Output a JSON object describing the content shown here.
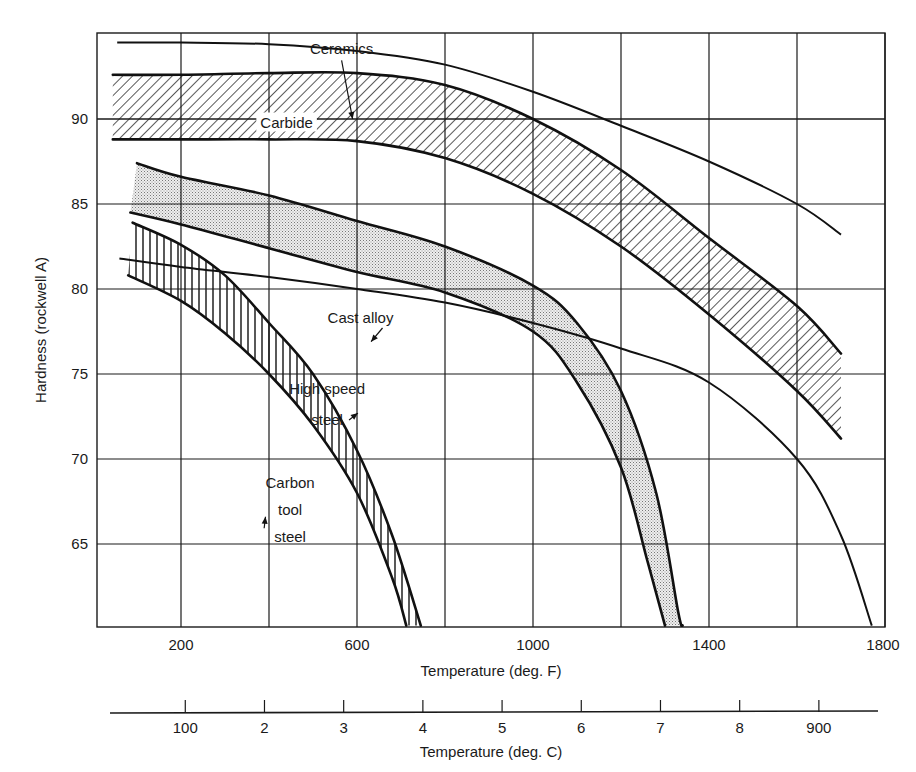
{
  "chart_data": {
    "type": "line",
    "title": "",
    "xlabel": "Temperature (deg. F)",
    "ylabel": "Hardness (rockwell A)",
    "secondary_xlabel": "Temperature (deg. C)",
    "xlim": [
      10,
      1800
    ],
    "ylim": [
      60.2,
      95
    ],
    "grid": true,
    "x_ticks": [
      200,
      600,
      1000,
      1400,
      1800
    ],
    "x_gridlines": [
      200,
      400,
      600,
      800,
      1000,
      1200,
      1400,
      1600,
      1800
    ],
    "y_ticks": [
      65,
      70,
      75,
      80,
      85,
      90
    ],
    "secondary_x_ticks": [
      {
        "label": "100",
        "F": 212
      },
      {
        "label": "2",
        "F": 392
      },
      {
        "label": "3",
        "F": 572
      },
      {
        "label": "4",
        "F": 752
      },
      {
        "label": "5",
        "F": 932
      },
      {
        "label": "6",
        "F": 1112
      },
      {
        "label": "7",
        "F": 1292
      },
      {
        "label": "8",
        "F": 1472
      },
      {
        "label": "900",
        "F": 1652
      }
    ],
    "series": [
      {
        "name": "Ceramics",
        "kind": "line",
        "points": [
          [
            55,
            94.5
          ],
          [
            200,
            94.5
          ],
          [
            400,
            94.4
          ],
          [
            600,
            94.0
          ],
          [
            800,
            93.2
          ],
          [
            1000,
            91.6
          ],
          [
            1200,
            89.6
          ],
          [
            1400,
            87.5
          ],
          [
            1600,
            85.0
          ],
          [
            1700,
            83.2
          ]
        ]
      },
      {
        "name": "Carbide",
        "kind": "band",
        "fill": "diagonal-hatch",
        "upper": [
          [
            45,
            92.6
          ],
          [
            200,
            92.6
          ],
          [
            400,
            92.7
          ],
          [
            600,
            92.7
          ],
          [
            800,
            92.0
          ],
          [
            1000,
            90.0
          ],
          [
            1200,
            87.0
          ],
          [
            1400,
            83.0
          ],
          [
            1600,
            79.0
          ],
          [
            1700,
            76.2
          ]
        ],
        "lower": [
          [
            45,
            88.8
          ],
          [
            200,
            88.8
          ],
          [
            400,
            88.8
          ],
          [
            600,
            88.7
          ],
          [
            800,
            87.7
          ],
          [
            1000,
            85.6
          ],
          [
            1200,
            82.5
          ],
          [
            1400,
            78.5
          ],
          [
            1600,
            74.0
          ],
          [
            1700,
            71.2
          ]
        ]
      },
      {
        "name": "High speed steel",
        "kind": "band",
        "fill": "stipple",
        "upper": [
          [
            100,
            87.4
          ],
          [
            200,
            86.6
          ],
          [
            400,
            85.5
          ],
          [
            600,
            84.0
          ],
          [
            800,
            82.5
          ],
          [
            1000,
            80.2
          ],
          [
            1100,
            78.0
          ],
          [
            1200,
            74.0
          ],
          [
            1280,
            68.0
          ],
          [
            1330,
            61.0
          ],
          [
            1340,
            60.2
          ]
        ],
        "lower": [
          [
            85,
            84.5
          ],
          [
            200,
            83.8
          ],
          [
            400,
            82.4
          ],
          [
            600,
            81.0
          ],
          [
            800,
            79.8
          ],
          [
            1000,
            77.5
          ],
          [
            1100,
            74.5
          ],
          [
            1200,
            69.5
          ],
          [
            1260,
            64.0
          ],
          [
            1300,
            60.2
          ]
        ]
      },
      {
        "name": "Cast alloy",
        "kind": "line",
        "points": [
          [
            60,
            81.8
          ],
          [
            200,
            81.3
          ],
          [
            400,
            80.7
          ],
          [
            600,
            80.0
          ],
          [
            800,
            79.2
          ],
          [
            1000,
            78.0
          ],
          [
            1200,
            76.5
          ],
          [
            1400,
            74.5
          ],
          [
            1600,
            70.0
          ],
          [
            1700,
            65.5
          ],
          [
            1770,
            60.2
          ]
        ]
      },
      {
        "name": "Carbon tool steel",
        "kind": "band",
        "fill": "vertical-hatch",
        "upper": [
          [
            90,
            83.9
          ],
          [
            200,
            82.6
          ],
          [
            300,
            80.8
          ],
          [
            400,
            78.0
          ],
          [
            500,
            75.0
          ],
          [
            600,
            70.5
          ],
          [
            680,
            65.5
          ],
          [
            745,
            60.2
          ]
        ],
        "lower": [
          [
            80,
            80.8
          ],
          [
            200,
            79.3
          ],
          [
            300,
            77.4
          ],
          [
            400,
            75.0
          ],
          [
            500,
            72.0
          ],
          [
            600,
            68.0
          ],
          [
            680,
            63.0
          ],
          [
            712,
            60.2
          ]
        ]
      }
    ],
    "annotations": [
      {
        "text": "Ceramics",
        "x": 565,
        "y": 93.8,
        "arrow_to": [
          590,
          90.0
        ]
      },
      {
        "text": "Carbide",
        "x": 440,
        "y": 89.5
      },
      {
        "text": "Cast alloy",
        "x": 608,
        "y": 78.0,
        "arrow_to": [
          632,
          76.9
        ]
      },
      {
        "text": "High speed",
        "x": 532,
        "y": 73.8
      },
      {
        "text": "steel",
        "x": 532,
        "y": 72.0,
        "arrow_to": [
          602,
          72.7
        ]
      },
      {
        "text": "Carbon",
        "x": 448,
        "y": 68.3
      },
      {
        "text": "tool",
        "x": 448,
        "y": 66.7
      },
      {
        "text": "steel",
        "x": 448,
        "y": 65.1,
        "arrow_to": [
          392,
          66.6
        ]
      }
    ]
  }
}
